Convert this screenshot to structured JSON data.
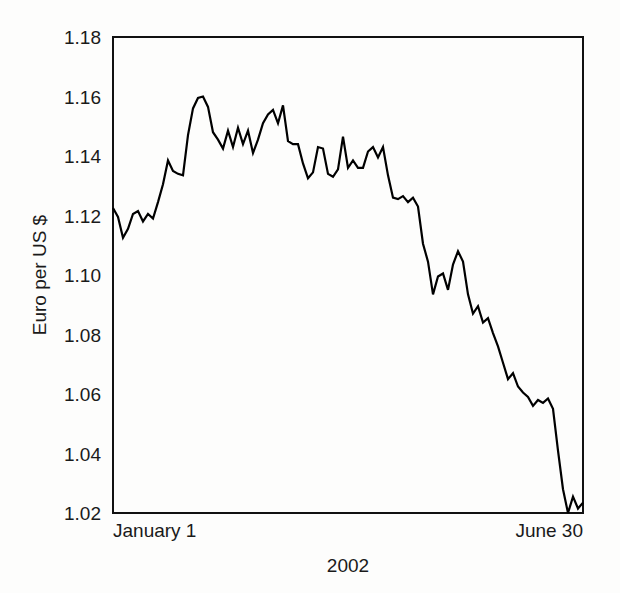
{
  "chart_data": {
    "type": "line",
    "title": "",
    "xlabel": "2002",
    "ylabel": "Euro per US $",
    "ylim": [
      1.02,
      1.18
    ],
    "yticks": [
      "1.02",
      "1.04",
      "1.06",
      "1.08",
      "1.10",
      "1.12",
      "1.14",
      "1.16",
      "1.18"
    ],
    "ytick_values": [
      1.02,
      1.04,
      1.06,
      1.08,
      1.1,
      1.12,
      1.14,
      1.16,
      1.18
    ],
    "xtick_labels": [
      "January 1",
      "June 30"
    ],
    "x_start_label": "January 1",
    "x_end_label": "June 30",
    "grid": false,
    "legend": null,
    "series": [
      {
        "name": "Euro per US $",
        "color": "#000000",
        "values": [
          1.1225,
          1.1195,
          1.1125,
          1.1155,
          1.1205,
          1.1215,
          1.118,
          1.1205,
          1.119,
          1.1245,
          1.1305,
          1.1385,
          1.135,
          1.134,
          1.1335,
          1.147,
          1.156,
          1.1595,
          1.16,
          1.1565,
          1.148,
          1.1455,
          1.1425,
          1.1485,
          1.143,
          1.1495,
          1.144,
          1.1485,
          1.141,
          1.1455,
          1.151,
          1.154,
          1.1555,
          1.151,
          1.157,
          1.145,
          1.144,
          1.144,
          1.1375,
          1.1325,
          1.1345,
          1.143,
          1.1425,
          1.134,
          1.133,
          1.1355,
          1.1465,
          1.136,
          1.1385,
          1.136,
          1.136,
          1.1415,
          1.143,
          1.1395,
          1.143,
          1.1335,
          1.126,
          1.1255,
          1.1265,
          1.1245,
          1.126,
          1.123,
          1.1105,
          1.1045,
          1.0935,
          1.0995,
          1.1005,
          1.095,
          1.1035,
          1.108,
          1.1045,
          1.0935,
          1.087,
          1.0895,
          1.084,
          1.0855,
          1.0805,
          1.076,
          1.0705,
          1.065,
          1.067,
          1.0625,
          1.0605,
          1.059,
          1.056,
          1.058,
          1.057,
          1.0585,
          1.055,
          1.041,
          1.028,
          1.02,
          1.0255,
          1.0215,
          1.0235
        ]
      }
    ]
  },
  "plot_geometry": {
    "left": 113,
    "right": 583,
    "top": 37,
    "bottom": 513
  }
}
